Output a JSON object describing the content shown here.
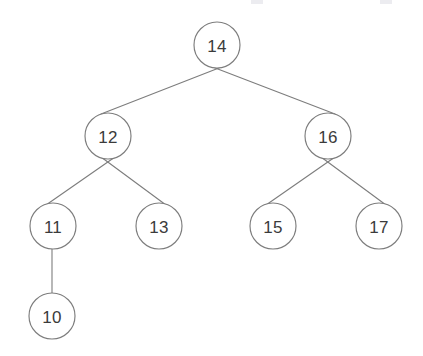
{
  "figure": {
    "type": "binary-search-tree-diagram",
    "background_color": "#ffffff",
    "node_fill_color": "#ffffff",
    "node_stroke_color": "#7d7d7d",
    "edge_color": "#7d7d7d",
    "label_color": "#3b3b3b",
    "node_radius": 23
  },
  "nodes": [
    {
      "id": "n14",
      "label": "14",
      "cx": 217,
      "cy": 45,
      "level": 0
    },
    {
      "id": "n12",
      "label": "12",
      "cx": 108,
      "cy": 136,
      "level": 1
    },
    {
      "id": "n16",
      "label": "16",
      "cx": 328,
      "cy": 136,
      "level": 1
    },
    {
      "id": "n11",
      "label": "11",
      "cx": 53,
      "cy": 226,
      "level": 2
    },
    {
      "id": "n13",
      "label": "13",
      "cx": 159,
      "cy": 226,
      "level": 2
    },
    {
      "id": "n15",
      "label": "15",
      "cx": 273,
      "cy": 226,
      "level": 2
    },
    {
      "id": "n17",
      "label": "17",
      "cx": 379,
      "cy": 226,
      "level": 2
    },
    {
      "id": "n10",
      "label": "10",
      "cx": 52,
      "cy": 316,
      "level": 3
    }
  ],
  "edges": [
    {
      "id": "e14-12",
      "from": "n14",
      "to": "n12",
      "x1": 224,
      "y1": 66,
      "x2": 101,
      "y2": 114
    },
    {
      "id": "e14-16",
      "from": "n14",
      "to": "n16",
      "x1": 210,
      "y1": 66,
      "x2": 335,
      "y2": 114
    },
    {
      "id": "e12-11",
      "from": "n12",
      "to": "n11",
      "x1": 115,
      "y1": 157,
      "x2": 46,
      "y2": 205
    },
    {
      "id": "e12-13",
      "from": "n12",
      "to": "n13",
      "x1": 101,
      "y1": 157,
      "x2": 166,
      "y2": 205
    },
    {
      "id": "e16-15",
      "from": "n16",
      "to": "n15",
      "x1": 335,
      "y1": 157,
      "x2": 266,
      "y2": 205
    },
    {
      "id": "e16-17",
      "from": "n16",
      "to": "n17",
      "x1": 321,
      "y1": 157,
      "x2": 386,
      "y2": 205
    },
    {
      "id": "e11-10",
      "from": "n11",
      "to": "n10",
      "x1": 52,
      "y1": 249,
      "x2": 52,
      "y2": 293
    }
  ],
  "artifacts": [
    {
      "id": "a1",
      "x": 251,
      "y": 0,
      "w": 12,
      "h": 4
    },
    {
      "id": "a2",
      "x": 380,
      "y": 0,
      "w": 12,
      "h": 4
    }
  ],
  "chart_data": {
    "type": "tree",
    "node_values": [
      14,
      12,
      16,
      11,
      13,
      15,
      17,
      10
    ],
    "root": "14",
    "structure": {
      "14": {
        "left": "12",
        "right": "16"
      },
      "12": {
        "left": "11",
        "right": "13"
      },
      "16": {
        "left": "15",
        "right": "17"
      },
      "11": {
        "left": "10",
        "right": null
      },
      "13": {
        "left": null,
        "right": null
      },
      "15": {
        "left": null,
        "right": null
      },
      "17": {
        "left": null,
        "right": null
      },
      "10": {
        "left": null,
        "right": null
      }
    },
    "depth": 4,
    "node_count": 8
  }
}
